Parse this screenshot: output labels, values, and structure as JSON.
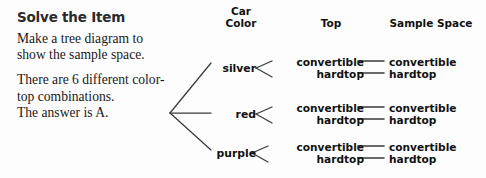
{
  "left_panel": {
    "heading": "Solve the Item",
    "paragraph_1": "Make a tree diagram to show the sample space.",
    "paragraph_2": "There are 6 different color-top combinations.",
    "paragraph_3": "The answer is A."
  },
  "diagram": {
    "headers": {
      "car_color": "Car\nColor",
      "top": "Top",
      "sample_space": "Sample Space"
    },
    "branches": [
      {
        "color": "silver",
        "tops": [
          "convertible",
          "hardtop"
        ],
        "sample_space": [
          "convertible",
          "hardtop"
        ]
      },
      {
        "color": "red",
        "tops": [
          "convertible",
          "hardtop"
        ],
        "sample_space": [
          "convertible",
          "hardtop"
        ]
      },
      {
        "color": "purple",
        "tops": [
          "convertible",
          "hardtop"
        ],
        "sample_space": [
          "convertible",
          "hardtop"
        ]
      }
    ],
    "line_color": "#3a3a3a"
  },
  "colors": {
    "background": "#fdfdfd",
    "heading_text": "#2b2b2b",
    "body_text": "#191919",
    "diagram_text": "#111111"
  }
}
